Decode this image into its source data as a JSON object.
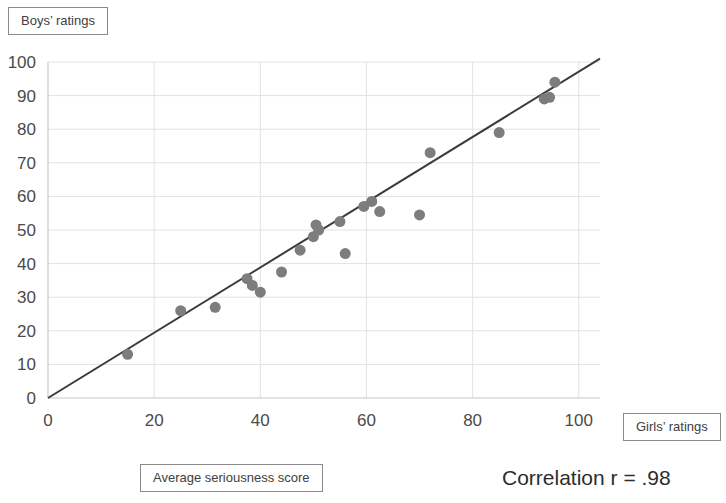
{
  "labels": {
    "y_axis_callout": "Boys’ ratings",
    "x_axis_callout": "Average seriousness score",
    "x_axis_end_callout": "Girls’ ratings",
    "correlation": "Correlation r = .98"
  },
  "chart_data": {
    "type": "scatter",
    "title": "",
    "subtitle": "",
    "xlabel": "Average seriousness score",
    "ylabel": "Boys’ ratings",
    "xlim": [
      0,
      104
    ],
    "ylim": [
      0,
      100
    ],
    "xticks": [
      0,
      20,
      40,
      60,
      80,
      100
    ],
    "yticks": [
      0,
      10,
      20,
      30,
      40,
      50,
      60,
      70,
      80,
      90,
      100
    ],
    "grid": true,
    "grid_axis": "y",
    "legend": "none",
    "point_color": "#7d7d7d",
    "point_size": 11,
    "trendline": {
      "show": true,
      "color": "#3b3b3b",
      "x_start": 0,
      "y_start": 0,
      "x_end": 104,
      "y_end": 101
    },
    "annotations": [
      {
        "text": "Correlation r = .98",
        "position": "below-right"
      }
    ],
    "points": [
      {
        "x": 15.0,
        "y": 13.0
      },
      {
        "x": 25.0,
        "y": 26.0
      },
      {
        "x": 31.5,
        "y": 27.0
      },
      {
        "x": 37.5,
        "y": 35.5
      },
      {
        "x": 38.5,
        "y": 33.5
      },
      {
        "x": 40.0,
        "y": 31.5
      },
      {
        "x": 44.0,
        "y": 37.5
      },
      {
        "x": 47.5,
        "y": 44.0
      },
      {
        "x": 50.0,
        "y": 48.0
      },
      {
        "x": 50.5,
        "y": 51.5
      },
      {
        "x": 51.0,
        "y": 50.0
      },
      {
        "x": 55.0,
        "y": 52.5
      },
      {
        "x": 56.0,
        "y": 43.0
      },
      {
        "x": 59.5,
        "y": 57.0
      },
      {
        "x": 61.0,
        "y": 58.5
      },
      {
        "x": 62.5,
        "y": 55.5
      },
      {
        "x": 70.0,
        "y": 54.5
      },
      {
        "x": 72.0,
        "y": 73.0
      },
      {
        "x": 85.0,
        "y": 79.0
      },
      {
        "x": 93.5,
        "y": 89.0
      },
      {
        "x": 94.5,
        "y": 89.5
      },
      {
        "x": 95.5,
        "y": 94.0
      }
    ]
  }
}
